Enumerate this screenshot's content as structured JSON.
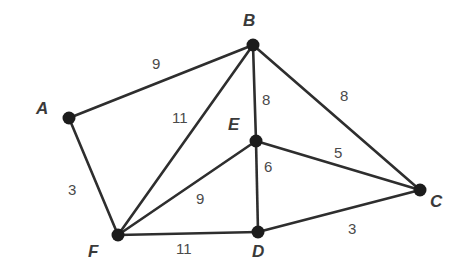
{
  "chart_data": {
    "type": "diagram",
    "title": "",
    "subtitle": "",
    "xlabel": "",
    "ylabel": "",
    "graph_kind": "undirected weighted graph",
    "background_color": "#ffffff",
    "edge_color": "#2e2e2e",
    "vertex_color": "#1c1c1c",
    "label_color": "#3a3a3a",
    "weight_color": "#4a4a4a",
    "nodes": [
      {
        "id": "A",
        "label": "A",
        "x": 69,
        "y": 118,
        "label_x": 36,
        "label_y": 100
      },
      {
        "id": "B",
        "label": "B",
        "x": 253,
        "y": 45,
        "label_x": 243,
        "label_y": 12
      },
      {
        "id": "C",
        "label": "C",
        "x": 420,
        "y": 190,
        "label_x": 430,
        "label_y": 193
      },
      {
        "id": "D",
        "label": "D",
        "x": 258,
        "y": 232,
        "label_x": 252,
        "label_y": 243
      },
      {
        "id": "E",
        "label": "E",
        "x": 256,
        "y": 141,
        "label_x": 228,
        "label_y": 116
      },
      {
        "id": "F",
        "label": "F",
        "x": 118,
        "y": 235,
        "label_x": 88,
        "label_y": 243
      }
    ],
    "edges": [
      {
        "source": "A",
        "target": "B",
        "weight": 9,
        "label": "9",
        "label_x": 152,
        "label_y": 56
      },
      {
        "source": "A",
        "target": "F",
        "weight": 3,
        "label": "3",
        "label_x": 68,
        "label_y": 182
      },
      {
        "source": "B",
        "target": "F",
        "weight": 11,
        "label": "11",
        "label_x": 172,
        "label_y": 110
      },
      {
        "source": "B",
        "target": "E",
        "weight": 8,
        "label": "8",
        "label_x": 262,
        "label_y": 92
      },
      {
        "source": "B",
        "target": "C",
        "weight": 8,
        "label": "8",
        "label_x": 340,
        "label_y": 88
      },
      {
        "source": "E",
        "target": "C",
        "weight": 5,
        "label": "5",
        "label_x": 334,
        "label_y": 145
      },
      {
        "source": "E",
        "target": "D",
        "weight": 6,
        "label": "6",
        "label_x": 264,
        "label_y": 159
      },
      {
        "source": "E",
        "target": "F",
        "weight": 9,
        "label": "9",
        "label_x": 196,
        "label_y": 191
      },
      {
        "source": "F",
        "target": "D",
        "weight": 11,
        "label": "11",
        "label_x": 176,
        "label_y": 241
      },
      {
        "source": "D",
        "target": "C",
        "weight": 3,
        "label": "3",
        "label_x": 348,
        "label_y": 221
      }
    ],
    "node_radius": 6.5,
    "edge_stroke_width": 2.6
  }
}
